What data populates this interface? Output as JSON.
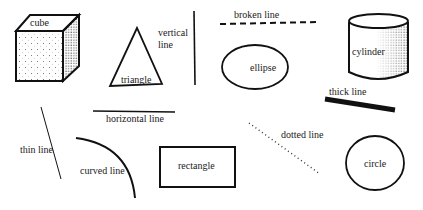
{
  "diagram": {
    "title": "",
    "labels": {
      "cube": "cube",
      "triangle": "triangle",
      "vertical_line_1": "vertical",
      "vertical_line_2": "line",
      "broken_line": "broken line",
      "ellipse": "ellipse",
      "cylinder": "cylinder",
      "thick_line": "thick line",
      "horizontal_line": "horizontal line",
      "thin_line": "thin line",
      "curved_line": "curved line",
      "rectangle": "rectangle",
      "dotted_line": "dotted line",
      "circle": "circle"
    },
    "colors": {
      "ink": "#111111",
      "background": "#ffffff"
    }
  }
}
